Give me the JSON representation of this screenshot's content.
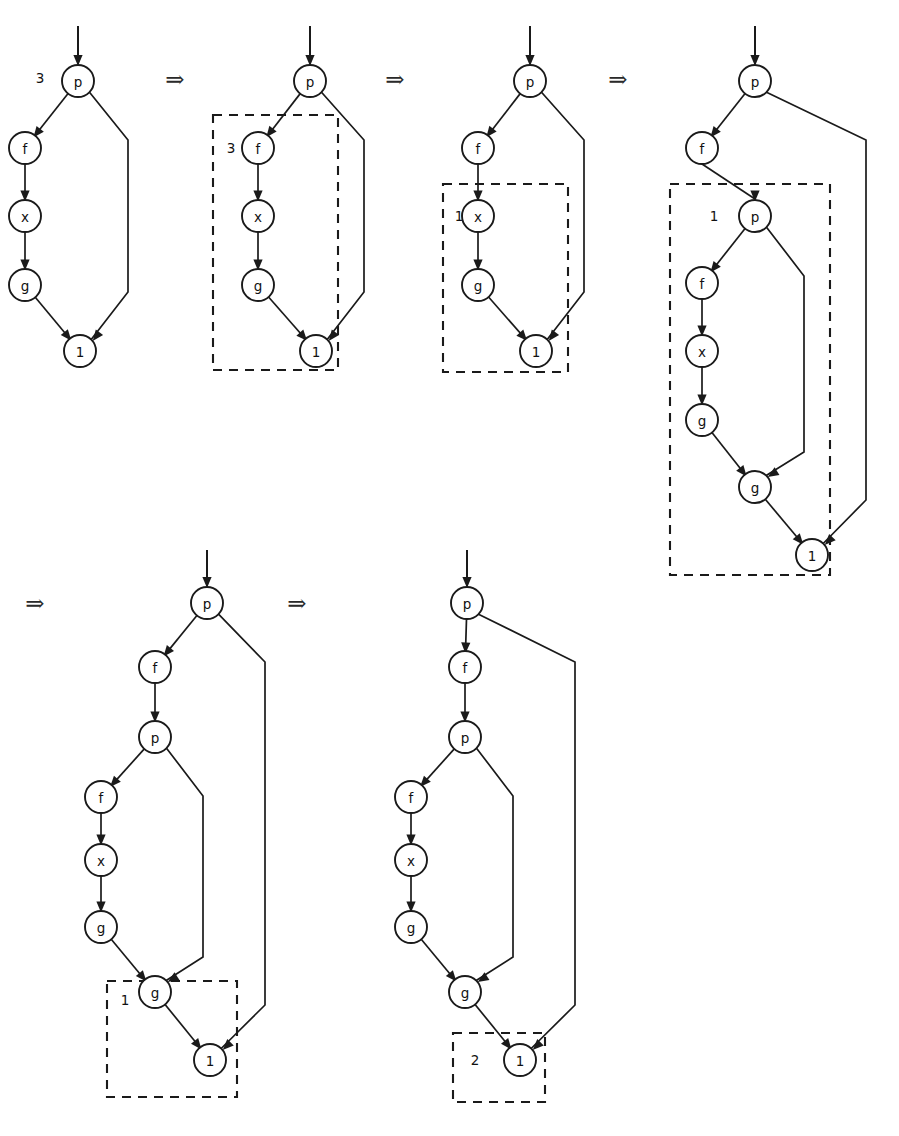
{
  "figure": {
    "node_radius": 16,
    "colors": {
      "ink": "#1a1a1a",
      "paper": "#ffffff"
    },
    "step_arrow_glyph": "⇒",
    "step_arrows": [
      {
        "id": "arrow-1",
        "x": 175,
        "y": 79
      },
      {
        "id": "arrow-2",
        "x": 395,
        "y": 79
      },
      {
        "id": "arrow-3",
        "x": 618,
        "y": 79
      },
      {
        "id": "arrow-4",
        "x": 35,
        "y": 603
      },
      {
        "id": "arrow-5",
        "x": 297,
        "y": 603
      }
    ],
    "graphs": [
      {
        "id": "graph-1",
        "entry": {
          "x": 78,
          "y": 26,
          "to": "g1-p"
        },
        "nodes": [
          {
            "id": "g1-p",
            "label": "p",
            "x": 78,
            "y": 81
          },
          {
            "id": "g1-f",
            "label": "f",
            "x": 25,
            "y": 148
          },
          {
            "id": "g1-x",
            "label": "x",
            "x": 25,
            "y": 216
          },
          {
            "id": "g1-g",
            "label": "g",
            "x": 25,
            "y": 285
          },
          {
            "id": "g1-1",
            "label": "1",
            "x": 80,
            "y": 351
          }
        ],
        "edges": [
          {
            "from": "g1-p",
            "to": "g1-f",
            "kind": "diag"
          },
          {
            "from": "g1-f",
            "to": "g1-x",
            "kind": "straight"
          },
          {
            "from": "g1-x",
            "to": "g1-g",
            "kind": "straight"
          },
          {
            "from": "g1-g",
            "to": "g1-1",
            "kind": "diag"
          },
          {
            "from": "g1-p",
            "to": "g1-1",
            "kind": "bypass",
            "bx": 128,
            "by1": 140,
            "by2": 292
          }
        ],
        "box": null,
        "loose_label": {
          "text": "3",
          "x": 40,
          "y": 78
        }
      },
      {
        "id": "graph-2",
        "entry": {
          "x": 310,
          "y": 26,
          "to": "g2-p"
        },
        "nodes": [
          {
            "id": "g2-p",
            "label": "p",
            "x": 310,
            "y": 81
          },
          {
            "id": "g2-f",
            "label": "f",
            "x": 258,
            "y": 148
          },
          {
            "id": "g2-x",
            "label": "x",
            "x": 258,
            "y": 216
          },
          {
            "id": "g2-g",
            "label": "g",
            "x": 258,
            "y": 285
          },
          {
            "id": "g2-1",
            "label": "1",
            "x": 316,
            "y": 351
          }
        ],
        "edges": [
          {
            "from": "g2-p",
            "to": "g2-f",
            "kind": "diag"
          },
          {
            "from": "g2-f",
            "to": "g2-x",
            "kind": "straight"
          },
          {
            "from": "g2-x",
            "to": "g2-g",
            "kind": "straight"
          },
          {
            "from": "g2-g",
            "to": "g2-1",
            "kind": "diag"
          },
          {
            "from": "g2-p",
            "to": "g2-1",
            "kind": "bypass",
            "bx": 364,
            "by1": 140,
            "by2": 292
          }
        ],
        "box": {
          "x": 213,
          "y": 115,
          "w": 125,
          "h": 255,
          "label": "3",
          "label_x": 231,
          "label_y": 148
        },
        "loose_label": null
      },
      {
        "id": "graph-3",
        "entry": {
          "x": 530,
          "y": 26,
          "to": "g3-p"
        },
        "nodes": [
          {
            "id": "g3-p",
            "label": "p",
            "x": 530,
            "y": 81
          },
          {
            "id": "g3-f",
            "label": "f",
            "x": 478,
            "y": 148
          },
          {
            "id": "g3-x",
            "label": "x",
            "x": 478,
            "y": 216
          },
          {
            "id": "g3-g",
            "label": "g",
            "x": 478,
            "y": 285
          },
          {
            "id": "g3-1",
            "label": "1",
            "x": 536,
            "y": 351
          }
        ],
        "edges": [
          {
            "from": "g3-p",
            "to": "g3-f",
            "kind": "diag"
          },
          {
            "from": "g3-f",
            "to": "g3-x",
            "kind": "straight"
          },
          {
            "from": "g3-x",
            "to": "g3-g",
            "kind": "straight"
          },
          {
            "from": "g3-g",
            "to": "g3-1",
            "kind": "diag"
          },
          {
            "from": "g3-p",
            "to": "g3-1",
            "kind": "bypass",
            "bx": 584,
            "by1": 140,
            "by2": 292
          }
        ],
        "box": {
          "x": 443,
          "y": 184,
          "w": 125,
          "h": 188,
          "label": "1",
          "label_x": 459,
          "label_y": 216
        },
        "loose_label": null
      },
      {
        "id": "graph-4",
        "entry": {
          "x": 755,
          "y": 26,
          "to": "g4-p1"
        },
        "nodes": [
          {
            "id": "g4-p1",
            "label": "p",
            "x": 755,
            "y": 81
          },
          {
            "id": "g4-f1",
            "label": "f",
            "x": 702,
            "y": 148
          },
          {
            "id": "g4-p2",
            "label": "p",
            "x": 755,
            "y": 216
          },
          {
            "id": "g4-f2",
            "label": "f",
            "x": 702,
            "y": 283
          },
          {
            "id": "g4-x",
            "label": "x",
            "x": 702,
            "y": 351
          },
          {
            "id": "g4-g1",
            "label": "g",
            "x": 702,
            "y": 420
          },
          {
            "id": "g4-g2",
            "label": "g",
            "x": 755,
            "y": 487
          },
          {
            "id": "g4-1",
            "label": "1",
            "x": 812,
            "y": 555
          }
        ],
        "edges": [
          {
            "from": "g4-p1",
            "to": "g4-f1",
            "kind": "diag"
          },
          {
            "from": "g4-f1",
            "to": "g4-p2",
            "kind": "straight"
          },
          {
            "from": "g4-p2",
            "to": "g4-f2",
            "kind": "diag"
          },
          {
            "from": "g4-f2",
            "to": "g4-x",
            "kind": "straight"
          },
          {
            "from": "g4-x",
            "to": "g4-g1",
            "kind": "straight"
          },
          {
            "from": "g4-g1",
            "to": "g4-g2",
            "kind": "diag"
          },
          {
            "from": "g4-g2",
            "to": "g4-1",
            "kind": "diag"
          },
          {
            "from": "g4-p2",
            "to": "g4-g2",
            "kind": "bypass",
            "bx": 804,
            "by1": 276,
            "by2": 452
          },
          {
            "from": "g4-p1",
            "to": "g4-1",
            "kind": "bypass",
            "bx": 866,
            "by1": 140,
            "by2": 500
          }
        ],
        "box": {
          "x": 670,
          "y": 184,
          "w": 160,
          "h": 391,
          "label": "1",
          "label_x": 714,
          "label_y": 216
        },
        "loose_label": null
      },
      {
        "id": "graph-5",
        "entry": {
          "x": 207,
          "y": 550,
          "to": "g5-p1"
        },
        "nodes": [
          {
            "id": "g5-p1",
            "label": "p",
            "x": 207,
            "y": 603
          },
          {
            "id": "g5-f1",
            "label": "f",
            "x": 155,
            "y": 667
          },
          {
            "id": "g5-p2",
            "label": "p",
            "x": 155,
            "y": 737
          },
          {
            "id": "g5-f2",
            "label": "f",
            "x": 101,
            "y": 797
          },
          {
            "id": "g5-x",
            "label": "x",
            "x": 101,
            "y": 860
          },
          {
            "id": "g5-g1",
            "label": "g",
            "x": 101,
            "y": 927
          },
          {
            "id": "g5-g2",
            "label": "g",
            "x": 155,
            "y": 992
          },
          {
            "id": "g5-1",
            "label": "1",
            "x": 210,
            "y": 1060
          }
        ],
        "edges": [
          {
            "from": "g5-p1",
            "to": "g5-f1",
            "kind": "diag"
          },
          {
            "from": "g5-f1",
            "to": "g5-p2",
            "kind": "straight"
          },
          {
            "from": "g5-p2",
            "to": "g5-f2",
            "kind": "diag"
          },
          {
            "from": "g5-f2",
            "to": "g5-x",
            "kind": "straight"
          },
          {
            "from": "g5-x",
            "to": "g5-g1",
            "kind": "straight"
          },
          {
            "from": "g5-g1",
            "to": "g5-g2",
            "kind": "diag"
          },
          {
            "from": "g5-g2",
            "to": "g5-1",
            "kind": "diag"
          },
          {
            "from": "g5-p2",
            "to": "g5-g2",
            "kind": "bypass",
            "bx": 203,
            "by1": 796,
            "by2": 957
          },
          {
            "from": "g5-p1",
            "to": "g5-1",
            "kind": "bypass",
            "bx": 265,
            "by1": 662,
            "by2": 1005
          }
        ],
        "box": {
          "x": 107,
          "y": 981,
          "w": 130,
          "h": 116,
          "label": "1",
          "label_x": 125,
          "label_y": 1000
        },
        "loose_label": null
      },
      {
        "id": "graph-6",
        "entry": {
          "x": 467,
          "y": 550,
          "to": "g6-p1"
        },
        "nodes": [
          {
            "id": "g6-p1",
            "label": "p",
            "x": 467,
            "y": 603
          },
          {
            "id": "g6-f1",
            "label": "f",
            "x": 465,
            "y": 667
          },
          {
            "id": "g6-p2",
            "label": "p",
            "x": 465,
            "y": 737
          },
          {
            "id": "g6-f2",
            "label": "f",
            "x": 411,
            "y": 797
          },
          {
            "id": "g6-x",
            "label": "x",
            "x": 411,
            "y": 860
          },
          {
            "id": "g6-g1",
            "label": "g",
            "x": 411,
            "y": 927
          },
          {
            "id": "g6-g2",
            "label": "g",
            "x": 465,
            "y": 992
          },
          {
            "id": "g6-1",
            "label": "1",
            "x": 520,
            "y": 1060
          }
        ],
        "edges": [
          {
            "from": "g6-p1",
            "to": "g6-f1",
            "kind": "diag"
          },
          {
            "from": "g6-f1",
            "to": "g6-p2",
            "kind": "straight"
          },
          {
            "from": "g6-p2",
            "to": "g6-f2",
            "kind": "diag"
          },
          {
            "from": "g6-f2",
            "to": "g6-x",
            "kind": "straight"
          },
          {
            "from": "g6-x",
            "to": "g6-g1",
            "kind": "straight"
          },
          {
            "from": "g6-g1",
            "to": "g6-g2",
            "kind": "diag"
          },
          {
            "from": "g6-g2",
            "to": "g6-1",
            "kind": "diag"
          },
          {
            "from": "g6-p2",
            "to": "g6-g2",
            "kind": "bypass",
            "bx": 513,
            "by1": 796,
            "by2": 957
          },
          {
            "from": "g6-p1",
            "to": "g6-1",
            "kind": "bypass",
            "bx": 575,
            "by1": 662,
            "by2": 1005
          }
        ],
        "box": {
          "x": 453,
          "y": 1033,
          "w": 92,
          "h": 69,
          "label": "2",
          "label_x": 475,
          "label_y": 1060
        },
        "loose_label": null
      }
    ]
  },
  "chart_data": {
    "type": "diagram",
    "node_labels": [
      "p",
      "f",
      "x",
      "g",
      "1",
      "2"
    ],
    "redex_box_labels": [
      null,
      "3",
      "1",
      "1",
      "1",
      "2"
    ],
    "step_count": 5,
    "graph_node_sequences": [
      [
        "p",
        "f",
        "x",
        "g",
        "1"
      ],
      [
        "p",
        "f",
        "x",
        "g",
        "1"
      ],
      [
        "p",
        "f",
        "x",
        "g",
        "1"
      ],
      [
        "p",
        "f",
        "p",
        "f",
        "x",
        "g",
        "g",
        "1"
      ],
      [
        "p",
        "f",
        "p",
        "f",
        "x",
        "g",
        "g",
        "1"
      ],
      [
        "p",
        "f",
        "p",
        "f",
        "x",
        "g",
        "g",
        "1"
      ]
    ]
  }
}
